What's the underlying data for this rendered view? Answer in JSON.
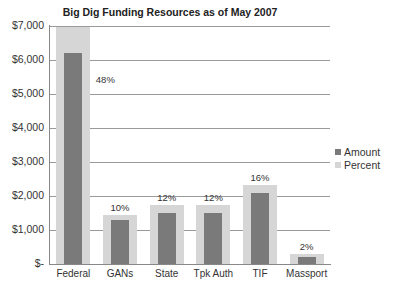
{
  "chart_data": {
    "type": "bar",
    "title": "Big Dig Funding Resources as of May 2007",
    "xlabel": "",
    "ylabel": "",
    "ylim": [
      0,
      7000
    ],
    "yticks": [
      "$-",
      "$1,000",
      "$2,000",
      "$3,000",
      "$4,000",
      "$5,000",
      "$6,000",
      "$7,000"
    ],
    "grid": true,
    "legend_position": "right",
    "categories": [
      "Federal",
      "GANs",
      "State",
      "Tpk Auth",
      "TIF",
      "Massport"
    ],
    "series": [
      {
        "name": "Amount",
        "color": "#7a7a7a",
        "values": [
          6200,
          1300,
          1500,
          1500,
          2100,
          200
        ]
      },
      {
        "name": "Percent",
        "color": "#d6d6d6",
        "values": [
          48,
          10,
          12,
          12,
          16,
          2
        ],
        "labels": [
          "48%",
          "10%",
          "12%",
          "12%",
          "16%",
          "2%"
        ]
      }
    ]
  },
  "legend": {
    "amount": "Amount",
    "percent": "Percent"
  }
}
